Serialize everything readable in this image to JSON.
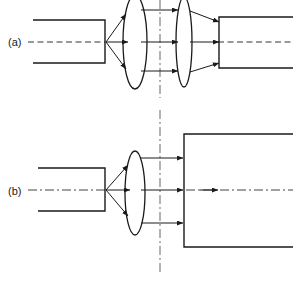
{
  "figure": {
    "stroke_color": "#1a1a1a",
    "axis_color": "#555555",
    "background": "#ffffff"
  },
  "panels": [
    {
      "id": "a",
      "label": "(a)",
      "label_x": 8,
      "label_y": 45,
      "axis_style": "dashed",
      "axis_y": 42,
      "source_block": {
        "x": 33,
        "y": 20,
        "width": 72,
        "height": 43,
        "open_side": "left"
      },
      "emit_point": {
        "x": 105,
        "y": 42
      },
      "lenses": [
        {
          "name": "lens-1",
          "cx": 135,
          "cy": 42,
          "rx": 12,
          "ry": 47
        },
        {
          "name": "lens-2",
          "cx": 184,
          "cy": 42,
          "rx": 8,
          "ry": 45
        }
      ],
      "ray_levels": [
        10,
        42,
        71
      ],
      "collimated_arrow_x": 178,
      "receiver_block": {
        "x": 218,
        "y": 15,
        "width": 75,
        "height": 55,
        "open_side": "right"
      },
      "vertical_axis_x": 160,
      "vertical_axis_y1": 0,
      "vertical_axis_y2": 98,
      "vertical_axis_style": "dash-dot"
    },
    {
      "id": "b",
      "label": "(b)",
      "label_x": 8,
      "label_y": 194,
      "axis_style": "dash-dot",
      "axis_y": 190,
      "source_block": {
        "x": 38,
        "y": 168,
        "width": 67,
        "height": 43,
        "open_side": "left"
      },
      "emit_point": {
        "x": 105,
        "y": 190
      },
      "lenses": [
        {
          "name": "lens-1",
          "cx": 135,
          "cy": 193,
          "rx": 10,
          "ry": 42
        }
      ],
      "ray_levels": [
        158,
        190,
        223
      ],
      "collimated_arrow_x": 182,
      "receiver_block": {
        "x": 184,
        "y": 134,
        "width": 109,
        "height": 113,
        "open_side": "right"
      },
      "vertical_axis_x": 160,
      "vertical_axis_y1": 110,
      "vertical_axis_y2": 275,
      "vertical_axis_style": "dash-dot",
      "interior_arrow_x": 215
    }
  ]
}
